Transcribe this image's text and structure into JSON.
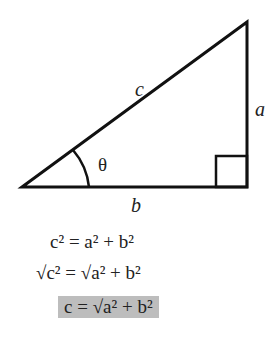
{
  "diagram": {
    "labels": {
      "hypotenuse": "c",
      "opposite": "a",
      "adjacent": "b",
      "angle": "θ"
    },
    "colors": {
      "stroke": "#111111",
      "highlight": "#bdbdbd"
    }
  },
  "equations": [
    {
      "text": "c² = a² + b²"
    },
    {
      "text": "√c² = √a² + b²"
    },
    {
      "text": "c = √a² + b²",
      "highlighted": true
    }
  ]
}
